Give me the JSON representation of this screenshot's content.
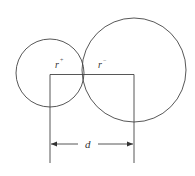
{
  "diagram": {
    "labels": {
      "cation_radius": "r",
      "cation_sign": "+",
      "anion_radius": "r",
      "anion_sign": "−",
      "distance": "d"
    },
    "colors": {
      "stroke": "#444444",
      "background": "#ffffff"
    },
    "shapes": {
      "small_circle": {
        "cx": 50,
        "cy": 73,
        "r": 35
      },
      "large_circle": {
        "cx": 134,
        "cy": 70,
        "r": 52
      }
    }
  }
}
